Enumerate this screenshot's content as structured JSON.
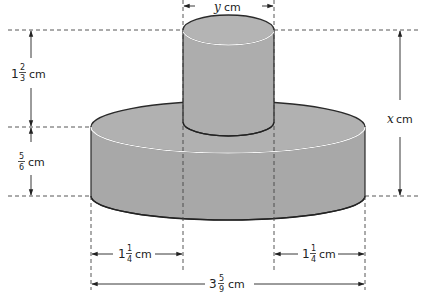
{
  "diagram": {
    "colors": {
      "solid_fill": "#a9a9a9",
      "top_fill": "#b3b3b3",
      "outline": "#2a2a2a",
      "highlight": "#f2f2f2",
      "dash": "#444444"
    },
    "labels": {
      "top_width": {
        "var": "y",
        "unit": "cm"
      },
      "total_height": {
        "var": "x",
        "unit": "cm"
      },
      "small_height": {
        "whole": "1",
        "num": "2",
        "den": "3",
        "unit": "cm"
      },
      "large_height": {
        "num": "5",
        "den": "6",
        "unit": "cm"
      },
      "left_offset": {
        "whole": "1",
        "num": "1",
        "den": "4",
        "unit": "cm"
      },
      "right_offset": {
        "whole": "1",
        "num": "1",
        "den": "4",
        "unit": "cm"
      },
      "base_width": {
        "whole": "3",
        "num": "5",
        "den": "9",
        "unit": "cm"
      }
    }
  }
}
